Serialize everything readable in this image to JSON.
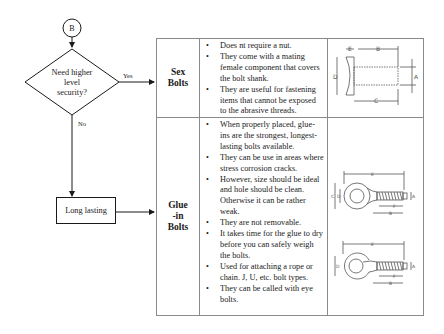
{
  "flowchart": {
    "connector_label": "B",
    "decision": {
      "lines": [
        "Need higher",
        "level",
        "security?"
      ],
      "yes_label": "Yes",
      "no_label": "No"
    },
    "process": {
      "label": "Long lasting"
    }
  },
  "table": {
    "rows": [
      {
        "name_lines": [
          "Sex",
          "Bolts"
        ],
        "bullets": [
          "Does nt require a nut.",
          "They come with a mating female component that covers the bolt shank.",
          "They are useful for fastening items that cannot be exposed to the abrasive threads."
        ],
        "diagram": {
          "type": "sex-bolt-dimension-drawing",
          "labels": [
            "E",
            "B",
            "D",
            "A",
            "C"
          ]
        }
      },
      {
        "name_lines": [
          "Glue",
          "-in",
          "Bolts"
        ],
        "bullets": [
          "When properly placed, glue-ins are the strongest, longest-lasting bolts available.",
          "They can be use in areas where stress corrosion cracks.",
          "However, size should be ideal and hole should be clean. Otherwise it can be rather weak.",
          "They are not removable.",
          "It takes time for the glue to dry before you can safely weigh the bolts.",
          "Used for attaching a rope or chain. J, U, etc. bolt types.",
          "They can be called with eye bolts."
        ],
        "diagrams": [
          {
            "type": "eye-bolt-dimension-drawing",
            "labels": [
              "E",
              "C",
              "D",
              "A",
              "F",
              "B"
            ]
          },
          {
            "type": "open-eye-bolt-dimension-drawing",
            "labels": [
              "E",
              "D",
              "A",
              "F",
              "B"
            ]
          }
        ]
      }
    ]
  }
}
